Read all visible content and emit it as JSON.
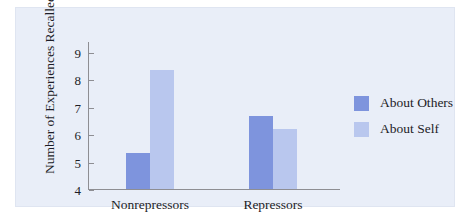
{
  "chart_data": {
    "type": "bar",
    "title": "",
    "xlabel": "",
    "ylabel": "Number of Experiences Recalled",
    "ylim": [
      4,
      9.4
    ],
    "yticks": [
      4,
      5,
      6,
      7,
      8,
      9
    ],
    "ytick_labels": [
      "4",
      "5",
      "6",
      "7",
      "8",
      "9"
    ],
    "categories": [
      "Nonrepressors",
      "Repressors"
    ],
    "grid": false,
    "legend_position": "right",
    "series": [
      {
        "name": "About Others",
        "color": "#7e94dd",
        "values": [
          5.3,
          6.65
        ]
      },
      {
        "name": "About Self",
        "color": "#b9c7ee",
        "values": [
          8.35,
          6.2
        ]
      }
    ]
  },
  "legend": {
    "items": [
      {
        "label": "About Others"
      },
      {
        "label": "About Self"
      }
    ]
  },
  "colors": {
    "panel_background": "#e9eef8",
    "axis": "#8e8e93",
    "text": "#1d1d27",
    "series_others": "#7e94dd",
    "series_self": "#b9c7ee"
  }
}
